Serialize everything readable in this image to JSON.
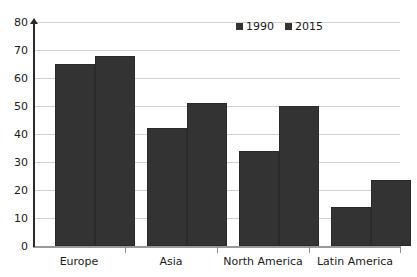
{
  "chart_data": {
    "type": "bar",
    "title": "",
    "subtitle": "",
    "xlabel": "",
    "ylabel": "",
    "categories": [
      "Europe",
      "Asia",
      "North America",
      "Latin America"
    ],
    "series": [
      {
        "name": "1990",
        "values": [
          65,
          42,
          34,
          14
        ],
        "color": "#333333"
      },
      {
        "name": "2015",
        "values": [
          68,
          51,
          50,
          23.5
        ],
        "color": "#333333"
      }
    ],
    "ylim": [
      0,
      80
    ],
    "yticks": [
      0,
      10,
      20,
      30,
      40,
      50,
      60,
      70,
      80
    ],
    "ytick_labels": [
      "0",
      "10",
      "20",
      "30",
      "40",
      "50",
      "60",
      "70",
      "80"
    ],
    "grid": true,
    "grid_axis": "y",
    "legend": {
      "position": "top-right",
      "entries": [
        "1990",
        "2015"
      ]
    },
    "bar_gap_within_group": 0,
    "axis_color": "#2b2b2b",
    "grid_color": "#d2d2d2",
    "background": "#ffffff"
  },
  "legend": {
    "items": [
      {
        "label": "1990",
        "swatch_name": "legend-swatch-1990"
      },
      {
        "label": "2015",
        "swatch_name": "legend-swatch-2015"
      }
    ]
  },
  "y_axis": {
    "ticks": [
      "80",
      "70",
      "60",
      "50",
      "40",
      "30",
      "20",
      "10",
      "0"
    ]
  },
  "x_axis": {
    "categories": [
      "Europe",
      "Asia",
      "North America",
      "Latin America"
    ]
  }
}
